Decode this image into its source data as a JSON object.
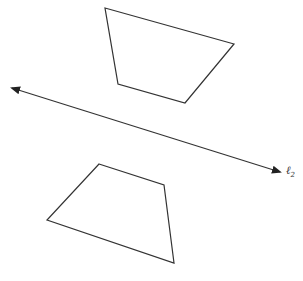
{
  "diagram": {
    "line": {
      "label": "ℓ",
      "subscript": "2",
      "start": [
        12,
        88
      ],
      "end": [
        280,
        172
      ],
      "arrows": "both"
    },
    "shapes": [
      {
        "name": "top-quadrilateral",
        "points": [
          [
            105,
            8
          ],
          [
            234,
            44
          ],
          [
            185,
            103
          ],
          [
            118,
            84
          ]
        ]
      },
      {
        "name": "bottom-quadrilateral",
        "points": [
          [
            99,
            164
          ],
          [
            164,
            185
          ],
          [
            174,
            263
          ],
          [
            47,
            220
          ]
        ]
      }
    ],
    "colors": {
      "stroke": "#333333",
      "background": "#ffffff"
    }
  }
}
